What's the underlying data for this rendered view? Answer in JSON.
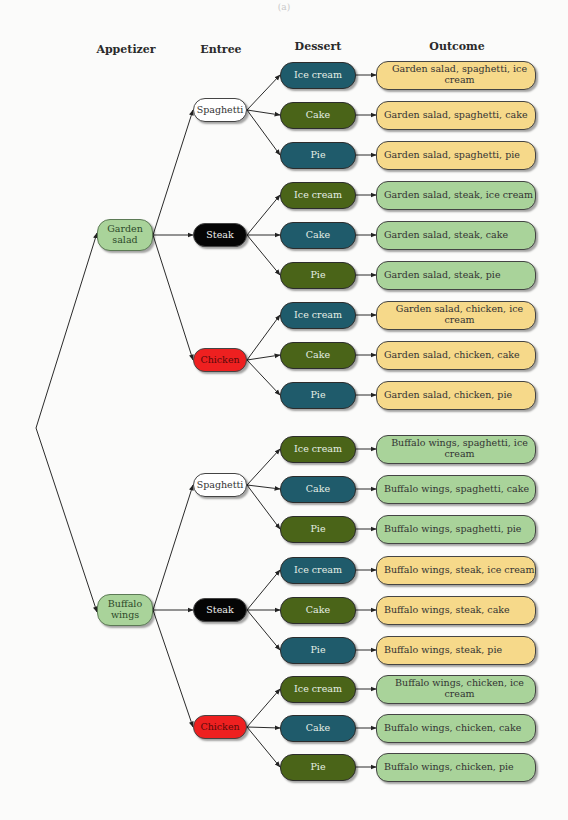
{
  "caption": "(a)",
  "headers": {
    "appetizer": "Appetizer",
    "entree": "Entree",
    "dessert": "Dessert",
    "outcome": "Outcome"
  },
  "colors": {
    "appetizer": "#a9d39a",
    "spaghetti": "#ffffff",
    "steak": "#050505",
    "chicken": "#ee2020",
    "dessert_teal": "#1f5b6b",
    "dessert_olive": "#4a6418",
    "outcome_yellow": "#f6d98a",
    "outcome_green": "#a9d39a"
  },
  "appetizers": [
    {
      "label": "Garden salad",
      "y": 235
    },
    {
      "label": "Buffalo wings",
      "y": 610
    }
  ],
  "entrees": [
    {
      "label": "Spaghetti",
      "y": 110,
      "color": "#ffffff",
      "text": "#333333"
    },
    {
      "label": "Steak",
      "y": 235,
      "color": "#050505",
      "text": "#f0f0f0"
    },
    {
      "label": "Chicken",
      "y": 360,
      "color": "#ee2020",
      "text": "#5a0a0a"
    },
    {
      "label": "Spaghetti",
      "y": 485,
      "color": "#ffffff",
      "text": "#333333"
    },
    {
      "label": "Steak",
      "y": 610,
      "color": "#050505",
      "text": "#f0f0f0"
    },
    {
      "label": "Chicken",
      "y": 727,
      "color": "#ee2020",
      "text": "#5a0a0a"
    }
  ],
  "rows": [
    {
      "dessert": "Ice cream",
      "dcolor": "#1f5b6b",
      "outcome": "Garden salad, spaghetti, ice cream",
      "ocolor": "#f6d98a",
      "y": 75
    },
    {
      "dessert": "Cake",
      "dcolor": "#4a6418",
      "outcome": "Garden salad, spaghetti, cake",
      "ocolor": "#f6d98a",
      "y": 115
    },
    {
      "dessert": "Pie",
      "dcolor": "#1f5b6b",
      "outcome": "Garden salad, spaghetti, pie",
      "ocolor": "#f6d98a",
      "y": 155
    },
    {
      "dessert": "Ice cream",
      "dcolor": "#4a6418",
      "outcome": "Garden salad, steak, ice cream",
      "ocolor": "#a9d39a",
      "y": 195
    },
    {
      "dessert": "Cake",
      "dcolor": "#1f5b6b",
      "outcome": "Garden salad, steak, cake",
      "ocolor": "#a9d39a",
      "y": 235
    },
    {
      "dessert": "Pie",
      "dcolor": "#4a6418",
      "outcome": "Garden salad, steak, pie",
      "ocolor": "#a9d39a",
      "y": 275
    },
    {
      "dessert": "Ice cream",
      "dcolor": "#1f5b6b",
      "outcome": "Garden salad, chicken, ice cream",
      "ocolor": "#f6d98a",
      "y": 315
    },
    {
      "dessert": "Cake",
      "dcolor": "#4a6418",
      "outcome": "Garden salad, chicken, cake",
      "ocolor": "#f6d98a",
      "y": 355
    },
    {
      "dessert": "Pie",
      "dcolor": "#1f5b6b",
      "outcome": "Garden salad, chicken, pie",
      "ocolor": "#f6d98a",
      "y": 395
    },
    {
      "dessert": "Ice cream",
      "dcolor": "#4a6418",
      "outcome": "Buffalo wings, spaghetti, ice cream",
      "ocolor": "#a9d39a",
      "y": 449
    },
    {
      "dessert": "Cake",
      "dcolor": "#1f5b6b",
      "outcome": "Buffalo wings, spaghetti, cake",
      "ocolor": "#a9d39a",
      "y": 489
    },
    {
      "dessert": "Pie",
      "dcolor": "#4a6418",
      "outcome": "Buffalo wings, spaghetti, pie",
      "ocolor": "#a9d39a",
      "y": 529
    },
    {
      "dessert": "Ice cream",
      "dcolor": "#1f5b6b",
      "outcome": "Buffalo wings, steak, ice cream",
      "ocolor": "#f6d98a",
      "y": 570
    },
    {
      "dessert": "Cake",
      "dcolor": "#4a6418",
      "outcome": "Buffalo wings, steak, cake",
      "ocolor": "#f6d98a",
      "y": 610
    },
    {
      "dessert": "Pie",
      "dcolor": "#1f5b6b",
      "outcome": "Buffalo wings, steak, pie",
      "ocolor": "#f6d98a",
      "y": 650
    },
    {
      "dessert": "Ice cream",
      "dcolor": "#4a6418",
      "outcome": "Buffalo wings, chicken, ice cream",
      "ocolor": "#a9d39a",
      "y": 689
    },
    {
      "dessert": "Cake",
      "dcolor": "#1f5b6b",
      "outcome": "Buffalo wings, chicken, cake",
      "ocolor": "#a9d39a",
      "y": 728
    },
    {
      "dessert": "Pie",
      "dcolor": "#4a6418",
      "outcome": "Buffalo wings, chicken, pie",
      "ocolor": "#a9d39a",
      "y": 767
    }
  ]
}
